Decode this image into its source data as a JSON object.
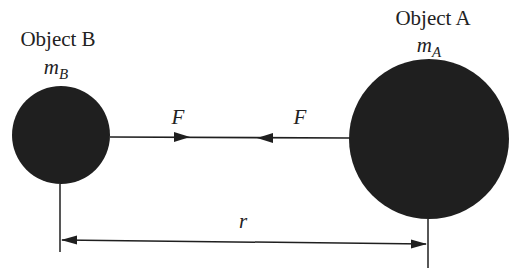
{
  "diagram": {
    "type": "gravitational-force-between-two-masses",
    "colors": {
      "ink": "#1f1f1f",
      "background": "#ffffff"
    },
    "object_b": {
      "title": "Object B",
      "mass_symbol": "m",
      "mass_subscript": "B"
    },
    "object_a": {
      "title": "Object A",
      "mass_symbol": "m",
      "mass_subscript": "A"
    },
    "forces": {
      "left_label": "F",
      "right_label": "F"
    },
    "distance": {
      "label": "r"
    }
  }
}
